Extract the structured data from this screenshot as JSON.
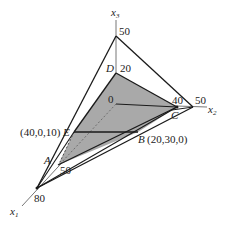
{
  "diagram": {
    "axes": {
      "x1": {
        "label": "x",
        "sub": "1",
        "ticks": [
          "50",
          "80"
        ]
      },
      "x2": {
        "label": "x",
        "sub": "2",
        "ticks": [
          "40",
          "50"
        ]
      },
      "x3": {
        "label": "x",
        "sub": "3",
        "ticks": [
          "20",
          "50"
        ]
      },
      "origin": "0"
    },
    "points": {
      "A": {
        "label": "A"
      },
      "B": {
        "label": "B",
        "coords": "(20,30,0)"
      },
      "C": {
        "label": "C"
      },
      "D": {
        "label": "D"
      },
      "E": {
        "label": "E",
        "coords": "(40,0,10)"
      }
    },
    "colors": {
      "line": "#1a1a1a",
      "fill": "#a9a9a9",
      "axis": "#555555"
    }
  }
}
